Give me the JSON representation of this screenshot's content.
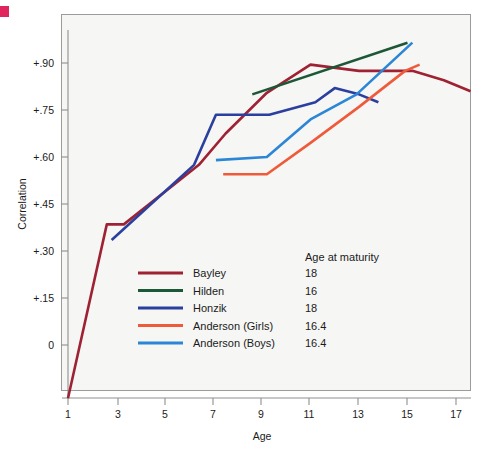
{
  "chart_data": {
    "type": "line",
    "title": "",
    "xlabel": "Age",
    "ylabel": "Correlation",
    "xlim": [
      1,
      17.6
    ],
    "ylim": [
      -0.18,
      1.03
    ],
    "xticks": [
      1,
      3,
      5,
      7,
      9,
      11,
      13,
      15,
      17
    ],
    "xtick_labels": [
      "1",
      "3",
      "5",
      "7",
      "9",
      "11",
      "13",
      "15",
      "17"
    ],
    "yticks": [
      0,
      0.15,
      0.3,
      0.45,
      0.6,
      0.75,
      0.9
    ],
    "ytick_labels": [
      "0",
      "+.15",
      "+.30",
      "+.45",
      "+.60",
      "+.75",
      "+.90"
    ],
    "grid": false,
    "legend_position": "inside-lower-left",
    "legend_extra_header": "Age at maturity",
    "series": [
      {
        "name": "Bayley",
        "color": "#9e2233",
        "age_at_maturity": "18",
        "x": [
          1.0,
          2.6,
          3.3,
          6.4,
          7.5,
          9.2,
          11.0,
          13.0,
          15.2,
          16.5,
          17.6
        ],
        "y": [
          -0.17,
          0.385,
          0.385,
          0.575,
          0.675,
          0.805,
          0.895,
          0.875,
          0.875,
          0.845,
          0.81
        ]
      },
      {
        "name": "Hilden",
        "color": "#1c5737",
        "age_at_maturity": "16",
        "x": [
          8.6,
          15.0
        ],
        "y": [
          0.8,
          0.965
        ]
      },
      {
        "name": "Honzik",
        "color": "#2a3f9e",
        "age_at_maturity": "18",
        "x": [
          2.8,
          6.2,
          7.1,
          9.3,
          11.2,
          12.0,
          13.0,
          13.8
        ],
        "y": [
          0.335,
          0.575,
          0.735,
          0.735,
          0.775,
          0.82,
          0.8,
          0.775
        ]
      },
      {
        "name": "Anderson (Girls)",
        "color": "#ef5b3a",
        "age_at_maturity": "16.4",
        "x": [
          7.4,
          9.2,
          11.0,
          13.0,
          14.9,
          15.5
        ],
        "y": [
          0.545,
          0.545,
          0.645,
          0.76,
          0.875,
          0.895
        ]
      },
      {
        "name": "Anderson (Boys)",
        "color": "#2b86d6",
        "age_at_maturity": "16.4",
        "x": [
          7.1,
          9.2,
          11.0,
          12.9,
          15.2
        ],
        "y": [
          0.59,
          0.6,
          0.72,
          0.8,
          0.965
        ]
      }
    ]
  },
  "legend": {
    "header_right": "Age at maturity",
    "rows": [
      {
        "label": "Bayley",
        "value": "18",
        "color": "#9e2233"
      },
      {
        "label": "Hilden",
        "value": "16",
        "color": "#1c5737"
      },
      {
        "label": "Honzik",
        "value": "18",
        "color": "#2a3f9e"
      },
      {
        "label": "Anderson (Girls)",
        "value": "16.4",
        "color": "#ef5b3a"
      },
      {
        "label": "Anderson (Boys)",
        "value": "16.4",
        "color": "#2b86d6"
      }
    ]
  },
  "axes": {
    "x_title": "Age",
    "y_title": "Correlation",
    "x_tick_labels": [
      "1",
      "3",
      "5",
      "7",
      "9",
      "11",
      "13",
      "15",
      "17"
    ],
    "y_tick_labels": [
      "+.90",
      "+.75",
      "+.60",
      "+.45",
      "+.30",
      "+.15",
      "0"
    ]
  },
  "colors": {
    "bayley": "#9e2233",
    "hilden": "#1c5737",
    "honzik": "#2a3f9e",
    "anderson_girls": "#ef5b3a",
    "anderson_boys": "#2b86d6",
    "plot_background": "#f6f6f4",
    "axis": "#8f8f8d",
    "corner_mark": "#e0245e"
  }
}
